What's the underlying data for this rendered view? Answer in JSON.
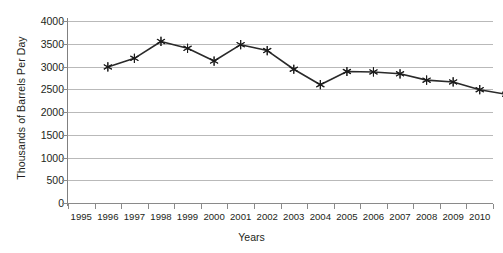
{
  "chart_data": {
    "type": "line",
    "title": "",
    "xlabel": "Years",
    "ylabel": "Thousands of Barrels Per Day",
    "ylim": [
      0,
      4000
    ],
    "ytick_step": 500,
    "yticks": [
      4000,
      3500,
      3000,
      2500,
      2000,
      1500,
      1000,
      500,
      0
    ],
    "ytick_labels": [
      "4000",
      "3500",
      "3000",
      "2500",
      "2000",
      "1500",
      "1000",
      "500",
      "0"
    ],
    "categories": [
      "1995",
      "1996",
      "1997",
      "1998",
      "1999",
      "2000",
      "2001",
      "2002",
      "2003",
      "2004",
      "2005",
      "2006",
      "2007",
      "2008",
      "2009",
      "2010"
    ],
    "xtick_labels": [
      "1995",
      "1996",
      "1997",
      "1998",
      "1999",
      "2000",
      "2001",
      "2002",
      "2003",
      "2004",
      "2005",
      "2006",
      "2007",
      "2008",
      "2009",
      "2010"
    ],
    "grid": true,
    "grid_axis": "y",
    "legend": false,
    "legend_position": "none",
    "marker": "star",
    "line_color": "#2a2a2a",
    "marker_color": "#1c1c1c",
    "grid_color": "#b9b9b9",
    "axis_color": "#8a8a8a",
    "background_color": "#ffffff",
    "series": [
      {
        "name": "Crude Oil Production",
        "points": [
          {
            "x": "1995",
            "y": null
          },
          {
            "x": "1996",
            "y": 2990
          },
          {
            "x": "1997",
            "y": 3180
          },
          {
            "x": "1998",
            "y": 3550
          },
          {
            "x": "1999",
            "y": 3400
          },
          {
            "x": "2000",
            "y": 3120
          },
          {
            "x": "2001",
            "y": 3480
          },
          {
            "x": "2002",
            "y": 3350
          },
          {
            "x": "2003",
            "y": 2940
          },
          {
            "x": "2004",
            "y": 2600
          },
          {
            "x": "2005",
            "y": 2890
          },
          {
            "x": "2006",
            "y": 2880
          },
          {
            "x": "2007",
            "y": 2840
          },
          {
            "x": "2008",
            "y": 2700
          },
          {
            "x": "2009",
            "y": 2660
          },
          {
            "x": "2010",
            "y": 2490
          },
          {
            "x": "",
            "y": 2390
          }
        ]
      }
    ]
  }
}
